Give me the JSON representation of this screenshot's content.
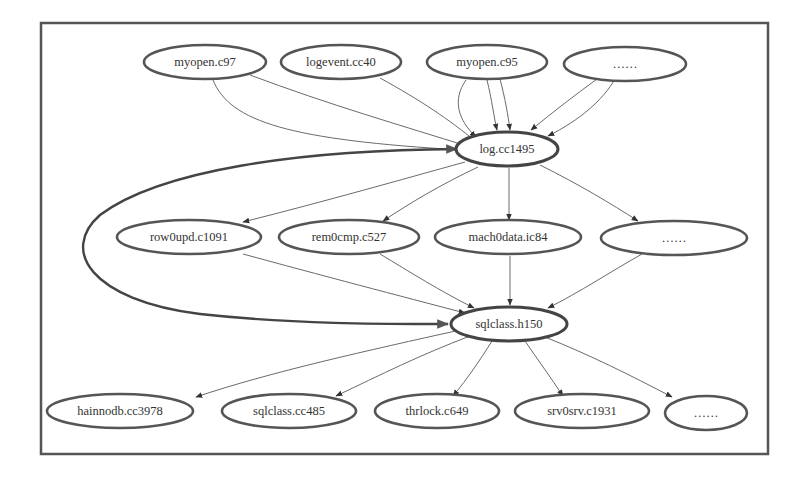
{
  "diagram": {
    "type": "dependency-graph",
    "nodes": {
      "n_myopen_c97": "myopen.c97",
      "n_logevent_cc40": "logevent.cc40",
      "n_myopen_c95": "myopen.c95",
      "n_top_more": "……",
      "n_log_cc1495": "log.cc1495",
      "n_row0upd_c1091": "row0upd.c1091",
      "n_rem0cmp_c527": "rem0cmp.c527",
      "n_mach0data_ic84": "mach0data.ic84",
      "n_mid_more": "……",
      "n_sqlclass_h150": "sqlclass.h150",
      "n_hainnodb_cc3978": "hainnodb.cc3978",
      "n_sqlclass_cc485": "sqlclass.cc485",
      "n_thrlock_c649": "thrlock.c649",
      "n_srv0srv_c1931": "srv0srv.c1931",
      "n_bot_more": "……"
    },
    "edges": [
      {
        "from": "myopen.c97",
        "to": "log.cc1495"
      },
      {
        "from": "myopen.c97",
        "to": "log.cc1495"
      },
      {
        "from": "logevent.cc40",
        "to": "log.cc1495"
      },
      {
        "from": "myopen.c95",
        "to": "log.cc1495"
      },
      {
        "from": "myopen.c95",
        "to": "log.cc1495"
      },
      {
        "from": "myopen.c95",
        "to": "log.cc1495"
      },
      {
        "from": "……",
        "to": "log.cc1495"
      },
      {
        "from": "……",
        "to": "log.cc1495"
      },
      {
        "from": "log.cc1495",
        "to": "row0upd.c1091"
      },
      {
        "from": "log.cc1495",
        "to": "rem0cmp.c527"
      },
      {
        "from": "log.cc1495",
        "to": "mach0data.ic84"
      },
      {
        "from": "log.cc1495",
        "to": "……"
      },
      {
        "from": "row0upd.c1091",
        "to": "sqlclass.h150"
      },
      {
        "from": "rem0cmp.c527",
        "to": "sqlclass.h150"
      },
      {
        "from": "mach0data.ic84",
        "to": "sqlclass.h150"
      },
      {
        "from": "……",
        "to": "sqlclass.h150"
      },
      {
        "from": "log.cc1495",
        "to": "sqlclass.h150",
        "style": "thick"
      },
      {
        "from": "sqlclass.h150",
        "to": "log.cc1495",
        "style": "thick"
      },
      {
        "from": "sqlclass.h150",
        "to": "hainnodb.cc3978"
      },
      {
        "from": "sqlclass.h150",
        "to": "sqlclass.cc485"
      },
      {
        "from": "sqlclass.h150",
        "to": "thrlock.c649"
      },
      {
        "from": "sqlclass.h150",
        "to": "srv0srv.c1931"
      },
      {
        "from": "sqlclass.h150",
        "to": "……"
      }
    ]
  }
}
